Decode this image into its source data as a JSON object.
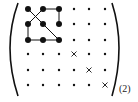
{
  "figure": {
    "subscript": "(2)",
    "grid": {
      "rows": 6,
      "cols": 6,
      "col_x": [
        28,
        43,
        59,
        74,
        89,
        105
      ],
      "row_y": [
        9,
        24,
        40,
        54,
        70,
        85
      ]
    },
    "large_dots": [
      [
        0,
        0
      ],
      [
        0,
        1
      ],
      [
        0,
        2
      ],
      [
        1,
        0
      ],
      [
        1,
        1
      ],
      [
        1,
        2
      ],
      [
        2,
        0
      ],
      [
        2,
        1
      ],
      [
        2,
        2
      ]
    ],
    "crosses": [
      [
        3,
        3
      ],
      [
        4,
        4
      ],
      [
        5,
        5
      ]
    ],
    "edges": [
      [
        [
          0,
          1
        ],
        [
          0,
          2
        ]
      ],
      [
        [
          0,
          2
        ],
        [
          1,
          2
        ]
      ],
      [
        [
          0,
          0
        ],
        [
          1,
          1
        ]
      ],
      [
        [
          1,
          1
        ],
        [
          2,
          2
        ]
      ],
      [
        [
          0,
          1
        ],
        [
          1,
          0
        ]
      ],
      [
        [
          1,
          0
        ],
        [
          2,
          0
        ]
      ],
      [
        [
          2,
          0
        ],
        [
          2,
          1
        ]
      ],
      [
        [
          2,
          1
        ],
        [
          2,
          2
        ]
      ]
    ],
    "colors": {
      "ink": "#111111"
    }
  }
}
